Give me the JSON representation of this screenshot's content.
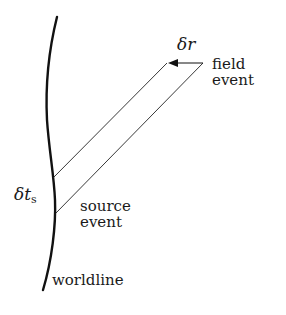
{
  "diagram": {
    "type": "spacetime-diagram",
    "colors": {
      "stroke": "#111111",
      "text": "#1a1a1a",
      "background": "#ffffff"
    },
    "labels": {
      "delta_r": {
        "symbol": "δr"
      },
      "field_event": {
        "line1": "field",
        "line2": "event"
      },
      "delta_ts": {
        "symbol": "δt",
        "subscript": "s"
      },
      "source_event": {
        "line1": "source",
        "line2": "event"
      },
      "worldline": "worldline"
    },
    "elements": {
      "worldline": "thick curved line representing the source's worldline",
      "light_cone_strip": "parallelogram of two parallel null lines from worldline to field event",
      "arrow": "arrow pointing left along the top edge, labelled δr"
    }
  }
}
